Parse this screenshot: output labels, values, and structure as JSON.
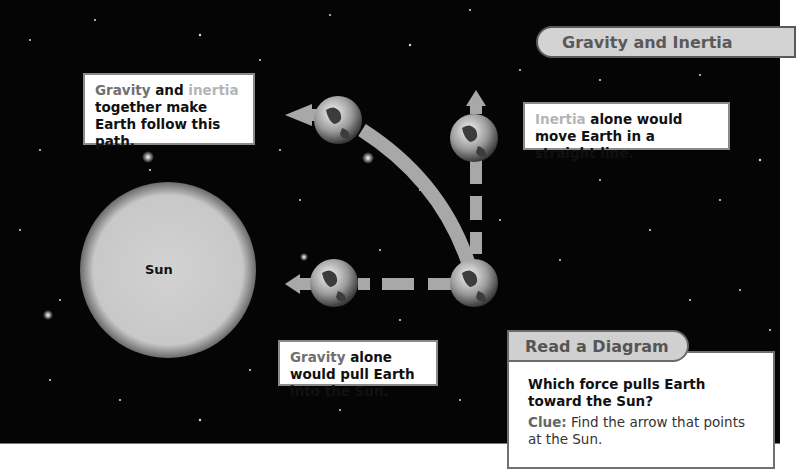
{
  "title": "Gravity and Inertia",
  "sun": {
    "label": "Sun"
  },
  "labels": {
    "combined": {
      "word1": "Gravity",
      "and": " and ",
      "word2": "inertia",
      "rest": "together make Earth follow this path."
    },
    "inertia": {
      "word": "Inertia",
      "rest": " alone would move Earth in a straight line."
    },
    "gravity": {
      "word": "Gravity",
      "rest": " alone would pull Earth into the Sun."
    }
  },
  "read_diagram": {
    "tab": "Read a Diagram",
    "question": "Which force pulls Earth toward the Sun?",
    "clue_label": "Clue:",
    "clue_text": " Find the arrow that points at the Sun."
  },
  "colors": {
    "space": "#050505",
    "arrow": "#a8a8a8",
    "gravity_text": "#707070",
    "inertia_text": "#b5b5b5",
    "tab_fill": "#d3d3d3"
  }
}
